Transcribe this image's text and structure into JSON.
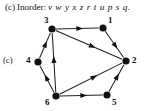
{
  "caption": {
    "prefix": "(c) Inorder:",
    "sequence": "v w y x z r t u p s q."
  },
  "figure": {
    "tag": "(c)"
  },
  "colors": {
    "ink": "#111111",
    "background": "#ffffff",
    "node_fill": "#101010",
    "edge": "#222222"
  },
  "graph": {
    "type": "directed-graph",
    "node_labels": {
      "n1": "1",
      "n2": "2",
      "n3": "3",
      "n4": "4",
      "n5": "5",
      "n6": "6"
    },
    "nodes": [
      {
        "id": "3",
        "label": "3",
        "cx": 52,
        "cy": 15,
        "label_x": 44,
        "label_y": 2
      },
      {
        "id": "1",
        "label": "1",
        "cx": 103,
        "cy": 14,
        "label_x": 108,
        "label_y": 2
      },
      {
        "id": "2",
        "label": "2",
        "cx": 126,
        "cy": 47,
        "label_x": 132,
        "label_y": 42
      },
      {
        "id": "4",
        "label": "4",
        "cx": 38,
        "cy": 48,
        "label_x": 26,
        "label_y": 42
      },
      {
        "id": "6",
        "label": "6",
        "cx": 56,
        "cy": 82,
        "label_x": 45,
        "label_y": 84
      },
      {
        "id": "5",
        "label": "5",
        "cx": 107,
        "cy": 81,
        "label_x": 112,
        "label_y": 84
      }
    ],
    "edges": [
      {
        "from": "3",
        "to": "1"
      },
      {
        "from": "3",
        "to": "2"
      },
      {
        "from": "1",
        "to": "2"
      },
      {
        "from": "4",
        "to": "3"
      },
      {
        "from": "6",
        "to": "3"
      },
      {
        "from": "6",
        "to": "4"
      },
      {
        "from": "6",
        "to": "2"
      },
      {
        "from": "6",
        "to": "5"
      },
      {
        "from": "5",
        "to": "2"
      }
    ]
  }
}
